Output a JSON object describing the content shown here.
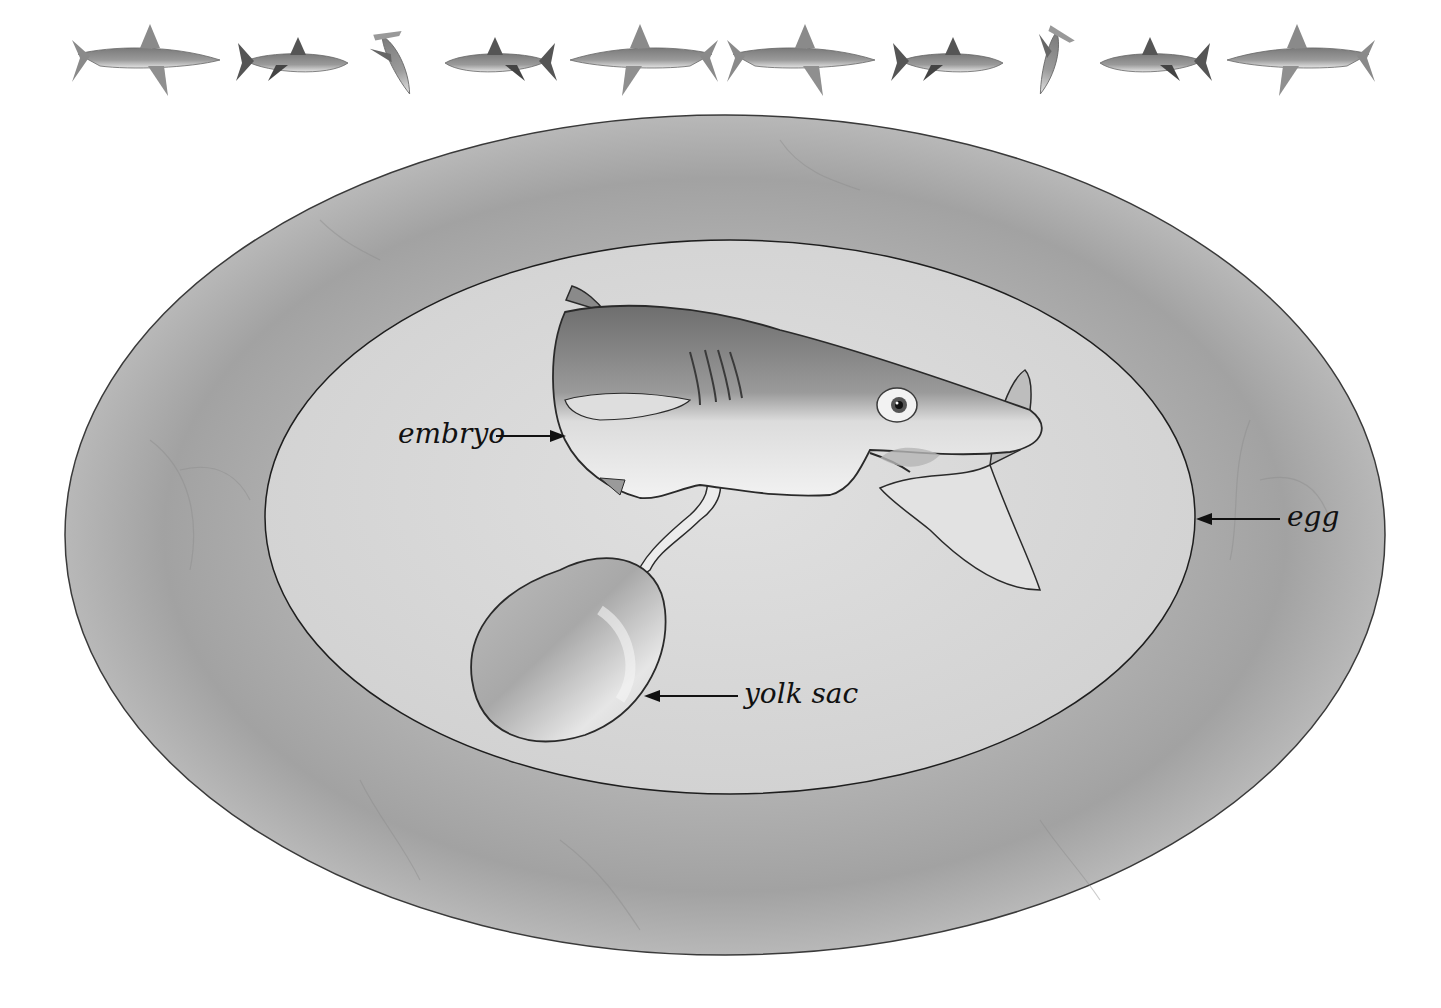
{
  "diagram": {
    "border_icons": [
      {
        "name": "oceanic-whitetip-shark-icon",
        "x": 150,
        "facing": "right"
      },
      {
        "name": "great-white-shark-icon",
        "x": 298,
        "facing": "left"
      },
      {
        "name": "hammerhead-shark-icon",
        "x": 398,
        "facing": "down"
      },
      {
        "name": "great-white-shark-icon",
        "x": 495,
        "facing": "right"
      },
      {
        "name": "oceanic-whitetip-shark-icon",
        "x": 640,
        "facing": "left"
      },
      {
        "name": "oceanic-whitetip-shark-icon",
        "x": 805,
        "facing": "right"
      },
      {
        "name": "great-white-shark-icon",
        "x": 953,
        "facing": "left"
      },
      {
        "name": "hammerhead-shark-icon",
        "x": 1052,
        "facing": "down"
      },
      {
        "name": "great-white-shark-icon",
        "x": 1150,
        "facing": "right"
      },
      {
        "name": "oceanic-whitetip-shark-icon",
        "x": 1297,
        "facing": "left"
      }
    ],
    "labels": {
      "embryo": "embryo",
      "egg": "egg",
      "yolk_sac": "yolk sac"
    },
    "colors": {
      "background": "#ffffff",
      "outer_ring": "#9c9c9c",
      "outer_ring_light": "#b4b4b4",
      "inner_egg": "#d8d8d8",
      "outline": "#2a2a2a",
      "embryo_dark": "#7a7a7a",
      "embryo_light": "#e8e8e8",
      "text": "#111111"
    }
  }
}
